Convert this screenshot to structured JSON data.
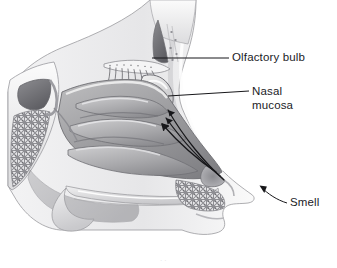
{
  "figure": {
    "background_color": "#ffffff",
    "ink_color": "#1b1b1f",
    "illustration_style": "grayscale pencil and wash medical illustration",
    "view": "mid-sagittal section, facing right"
  },
  "labels": [
    {
      "id": "olfactory-bulb",
      "text": "Olfactory bulb",
      "lines": [
        "Olfactory bulb"
      ],
      "leader": "horizontal line from label left edge to the cribriform plate region"
    },
    {
      "id": "nasal-mucosa",
      "text": "Nasal mucosa",
      "lines": [
        "Nasal",
        "mucosa"
      ],
      "leader": "line sloping up-right from the superior nasal cavity lining to the label"
    },
    {
      "id": "smell",
      "text": "Smell",
      "lines": [
        "Smell"
      ],
      "leader": "curved arrow pointing up-left toward the nostril and nasal vestibule"
    }
  ],
  "anatomy_parts": [
    "frontal sinus",
    "cribriform plate",
    "olfactory nerve filaments",
    "olfactory bulb",
    "superior turbinate",
    "middle turbinate",
    "inferior turbinate",
    "sphenoid sinus",
    "cancellous bone",
    "nasal septum wall",
    "hard palate",
    "soft palate",
    "nasal vestibule",
    "nostril",
    "nose tip",
    "upper lip"
  ],
  "airflow_arrows": {
    "count": 3,
    "description": "three parallel arrows running from the nostril up and back toward the olfactory region",
    "direction": "up-left toward the olfactory bulb"
  },
  "caption_stub": "· ·"
}
